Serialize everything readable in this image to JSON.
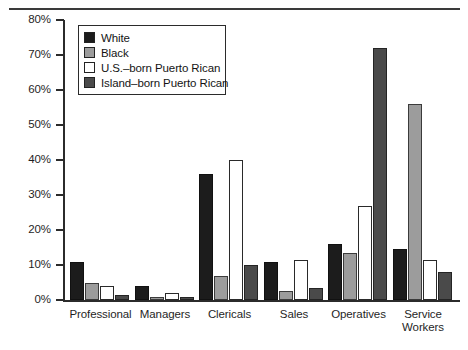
{
  "chart_data": {
    "type": "bar",
    "title": "",
    "subtitle": "",
    "xlabel": "",
    "ylabel": "",
    "ylim": [
      0,
      80
    ],
    "ytick_values": [
      0,
      10,
      20,
      30,
      40,
      50,
      60,
      70,
      80
    ],
    "ytick_labels": [
      "0%",
      "10%",
      "20%",
      "30%",
      "40%",
      "50%",
      "60%",
      "70%",
      "80%"
    ],
    "grid": false,
    "legend_position": "upper-left-inside",
    "categories": [
      "Professional",
      "Managers",
      "Clericals",
      "Sales",
      "Operatives",
      "Service\nWorkers"
    ],
    "series": [
      {
        "name": "White",
        "color": "#1c1c1c",
        "values": [
          11,
          4,
          36,
          11,
          16,
          14.5
        ]
      },
      {
        "name": "Black",
        "color": "#9c9c9c",
        "values": [
          5,
          1,
          7,
          2.5,
          13.5,
          56
        ]
      },
      {
        "name": "U.S.–born Puerto Rican",
        "color": "#ffffff",
        "values": [
          4,
          2,
          40,
          11.5,
          27,
          11.5
        ]
      },
      {
        "name": "Island–born Puerto Rican",
        "color": "#4a4a4a",
        "values": [
          1.5,
          1,
          10,
          3.5,
          72,
          8
        ]
      }
    ]
  },
  "legend": {
    "items": [
      {
        "label": "White",
        "swatch": "solid-black-swatch"
      },
      {
        "label": "Black",
        "swatch": "light-gray-swatch"
      },
      {
        "label": "U.S.–born Puerto Rican",
        "swatch": "white-swatch"
      },
      {
        "label": "Island–born Puerto Rican",
        "swatch": "dark-gray-swatch"
      }
    ]
  },
  "axis": {
    "y_labels": [
      "80%",
      "70%",
      "60%",
      "50%",
      "40%",
      "30%",
      "20%",
      "10%",
      "0%"
    ]
  }
}
